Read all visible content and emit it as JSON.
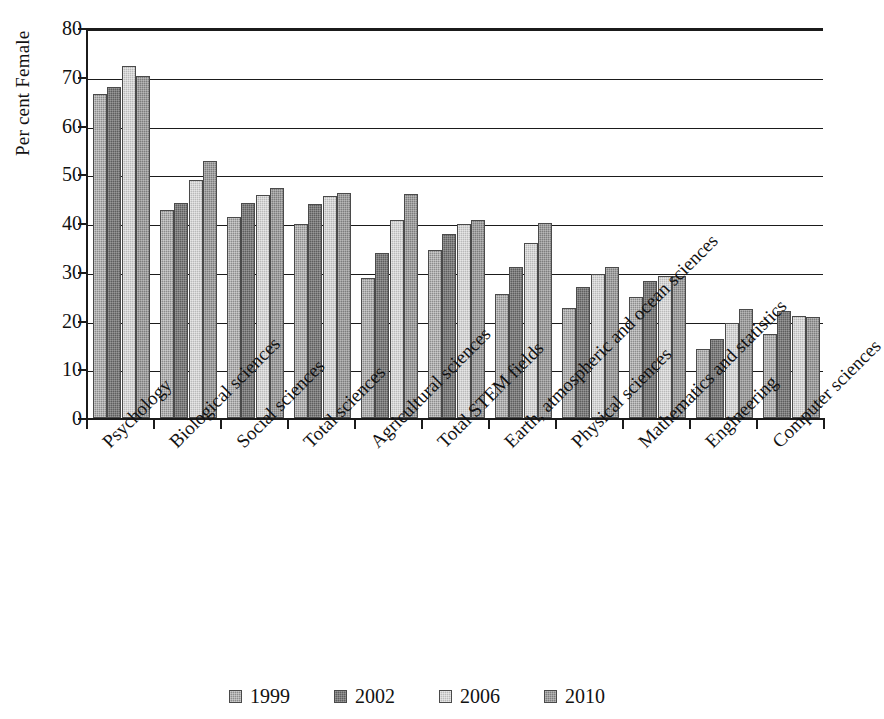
{
  "chart_data": {
    "type": "bar",
    "title": "",
    "xlabel": "",
    "ylabel": "Per cent Female",
    "ylim": [
      0,
      80
    ],
    "yticks": [
      0,
      10,
      20,
      30,
      40,
      50,
      60,
      70,
      80
    ],
    "grid": true,
    "legend_position": "bottom",
    "categories": [
      "Psychology",
      "Biological sciences",
      "Social sciences",
      "Total sciences",
      "Agricultural sciences",
      "Total STEM fields",
      "Earth, atmospheric and ocean sciences",
      "Physical sciences",
      "Mathematics and statistics",
      "Engineering",
      "Computer sciences"
    ],
    "series": [
      {
        "name": "1999",
        "color": "#8c8c8c",
        "values": [
          66.5,
          42.7,
          41.3,
          39.9,
          28.8,
          34.5,
          25.5,
          22.6,
          24.8,
          14.2,
          17.3
        ]
      },
      {
        "name": "2002",
        "color": "#5e5e5e",
        "values": [
          67.8,
          44.1,
          44.2,
          43.9,
          33.8,
          37.8,
          31.0,
          26.8,
          28.2,
          16.2,
          22.0
        ]
      },
      {
        "name": "2006",
        "color": "#b9b9b9",
        "values": [
          72.3,
          48.9,
          45.7,
          45.6,
          40.6,
          39.7,
          35.9,
          29.5,
          29.2,
          19.5,
          21.0
        ]
      },
      {
        "name": "2010",
        "color": "#7d7d7d",
        "values": [
          70.2,
          52.8,
          47.1,
          46.2,
          45.9,
          40.6,
          40.0,
          31.0,
          29.2,
          22.3,
          20.8
        ]
      }
    ]
  },
  "legend": {
    "entries": [
      {
        "label": "1999",
        "swatch": "legend-swatch-1999"
      },
      {
        "label": "2002",
        "swatch": "legend-swatch-2002"
      },
      {
        "label": "2006",
        "swatch": "legend-swatch-2006"
      },
      {
        "label": "2010",
        "swatch": "legend-swatch-2010"
      }
    ]
  }
}
